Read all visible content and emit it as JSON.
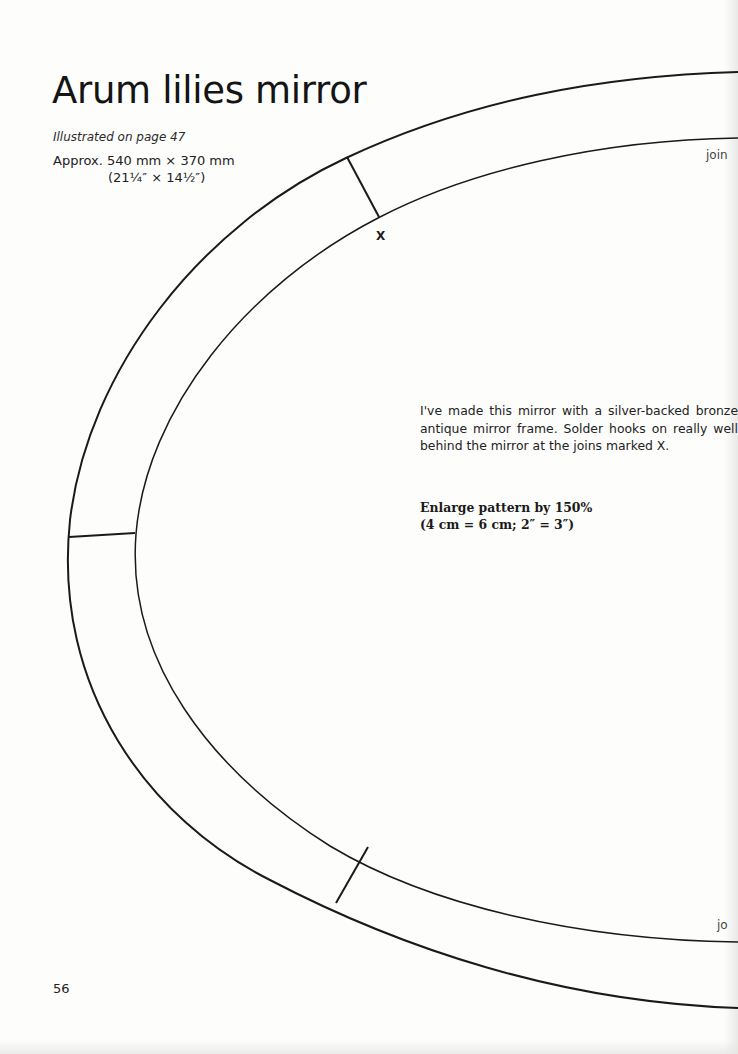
{
  "page": {
    "title": "Arum lilies mirror",
    "subtitle": "Illustrated on page 47",
    "size_metric": "Approx. 540 mm × 370 mm",
    "size_imperial": "(21¼″ × 14½″)",
    "description": "I've made this mirror with a silver-backed bronze antique mirror frame. Solder hooks on really well behind the mirror at the joins marked X.",
    "enlarge_heading": "Enlarge pattern by 150%",
    "enlarge_detail": "(4 cm = 6 cm; 2″ = 3″)",
    "page_number": "56"
  },
  "pattern": {
    "join_label_top": "join",
    "join_label_bottom": "jo",
    "x_mark": "X",
    "segments": 4,
    "scale_percent": 150
  },
  "colors": {
    "ink": "#1a1a1a",
    "paper": "#fdfdfc"
  }
}
